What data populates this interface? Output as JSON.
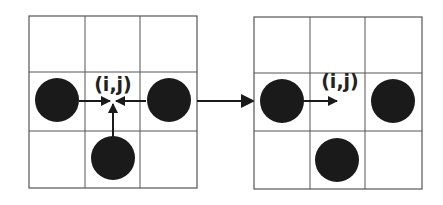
{
  "diagram": {
    "type": "grid-transition",
    "colors": {
      "grid_line": "#555555",
      "disc": "#1a1a1a",
      "arrow": "#1a1a1a",
      "background": "#ffffff"
    },
    "before": {
      "label": "(i,j)",
      "grid": "3x3",
      "discs": [
        "left",
        "right",
        "bottom"
      ],
      "arrows_into_center": [
        "from-left",
        "from-right",
        "from-bottom"
      ]
    },
    "transition_arrow": "left-to-right",
    "after": {
      "label": "(i,j)",
      "grid": "3x3",
      "discs": [
        "left",
        "right",
        "bottom"
      ],
      "arrows": [
        "left-disc-to-center"
      ]
    }
  }
}
